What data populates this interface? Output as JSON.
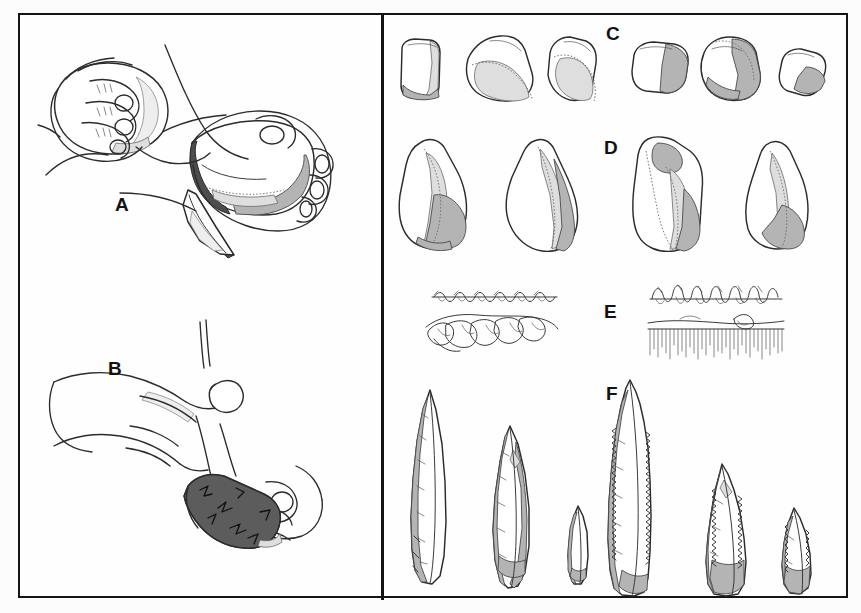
{
  "figure": {
    "kind": "scientific-illustration",
    "background_color": "#fcfcfc",
    "frame_color": "#141414",
    "panel_divider_x": 361
  },
  "palette": {
    "outline": "#2b2b2b",
    "shade_dark": "#4d4d4d",
    "shade_core_dark": "#5c5c5c",
    "shade_mid": "#b4b4b4",
    "shade_light": "#dedede",
    "shade_extra_light": "#eeeeee",
    "paper": "#ffffff",
    "label_text": "#121212"
  },
  "panels": [
    {
      "id": "A",
      "label": "A",
      "side": "left",
      "label_x": 95,
      "label_y": 186,
      "caption_hidden": "hands holding hammerstone striking a core, detached flake below",
      "elements": [
        "left-hand-with-hammerstone",
        "right-hand-holding-core",
        "detached-flake"
      ]
    },
    {
      "id": "B",
      "label": "B",
      "side": "left",
      "label_x": 88,
      "label_y": 360,
      "caption_hidden": "indirect percussion with punch held against core in hand",
      "elements": [
        "upper-hand-with-punch",
        "lower-hand-holding-dark-core",
        "punch-rod"
      ]
    },
    {
      "id": "C",
      "label": "C",
      "side": "right",
      "label_x": 606,
      "label_y": 28,
      "caption_hidden": "row of six small flakes and flake fragments",
      "item_count": 6
    },
    {
      "id": "D",
      "label": "D",
      "side": "right",
      "label_x": 604,
      "label_y": 139,
      "caption_hidden": "row of four large retouched flake tools",
      "item_count": 4
    },
    {
      "id": "E",
      "label": "E",
      "side": "right",
      "label_x": 607,
      "label_y": 294,
      "caption_hidden": "four microwear edge profile details",
      "item_count": 4
    },
    {
      "id": "F",
      "label": "F",
      "side": "right",
      "label_x": 606,
      "label_y": 384,
      "caption_hidden": "row of six bifacial projectile points with serrated edges",
      "item_count": 6
    }
  ],
  "row_c_items": [
    {
      "name": "flake-c1",
      "x": 401,
      "y": 44,
      "w": 40,
      "h": 56
    },
    {
      "name": "flake-c2",
      "x": 468,
      "y": 41,
      "w": 52,
      "h": 60
    },
    {
      "name": "flake-c3",
      "x": 548,
      "y": 43,
      "w": 45,
      "h": 58
    },
    {
      "name": "flake-c4",
      "x": 634,
      "y": 48,
      "w": 48,
      "h": 46
    },
    {
      "name": "flake-c5",
      "x": 707,
      "y": 40,
      "w": 48,
      "h": 60
    },
    {
      "name": "flake-c6",
      "x": 782,
      "y": 52,
      "w": 40,
      "h": 48
    }
  ],
  "row_d_items": [
    {
      "name": "tool-d1",
      "x": 401,
      "y": 138,
      "w": 70,
      "h": 118
    },
    {
      "name": "tool-d2",
      "x": 521,
      "y": 135,
      "w": 68,
      "h": 122
    },
    {
      "name": "tool-d3",
      "x": 648,
      "y": 134,
      "w": 72,
      "h": 122
    },
    {
      "name": "tool-d4",
      "x": 760,
      "y": 140,
      "w": 62,
      "h": 115
    }
  ],
  "row_e_items": [
    {
      "name": "edge-profile-e1",
      "x": 440,
      "y": 287,
      "w": 130,
      "h": 16,
      "style": "fine-scalar-retouch"
    },
    {
      "name": "edge-profile-e2",
      "x": 650,
      "y": 283,
      "w": 135,
      "h": 20,
      "style": "dense-stepped-retouch"
    },
    {
      "name": "edge-profile-e3",
      "x": 440,
      "y": 318,
      "w": 135,
      "h": 28,
      "style": "large-flake-scars"
    },
    {
      "name": "edge-profile-e4",
      "x": 650,
      "y": 318,
      "w": 140,
      "h": 30,
      "style": "striated-polish-hatching"
    }
  ],
  "row_f_items": [
    {
      "name": "point-f1",
      "x": 412,
      "y": 392,
      "w": 46,
      "h": 180,
      "serrated": false
    },
    {
      "name": "point-f2",
      "x": 492,
      "y": 430,
      "w": 44,
      "h": 150,
      "serrated": false
    },
    {
      "name": "point-f3",
      "x": 566,
      "y": 510,
      "w": 24,
      "h": 70,
      "serrated": false
    },
    {
      "name": "point-f4",
      "x": 620,
      "y": 382,
      "w": 50,
      "h": 198,
      "serrated": true
    },
    {
      "name": "point-f5",
      "x": 700,
      "y": 465,
      "w": 46,
      "h": 115,
      "serrated": true
    },
    {
      "name": "point-f6",
      "x": 778,
      "y": 508,
      "w": 34,
      "h": 72,
      "serrated": true
    }
  ]
}
